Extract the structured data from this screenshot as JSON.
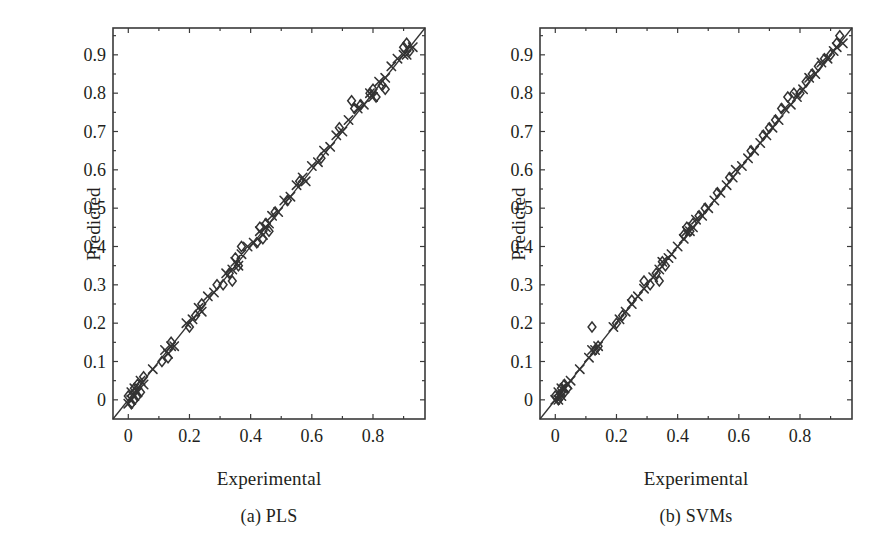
{
  "figure": {
    "panels": [
      {
        "id": "a",
        "caption": "(a) PLS",
        "xlabel": "Experimental",
        "ylabel": "Predicted"
      },
      {
        "id": "b",
        "caption": "(b) SVMs",
        "xlabel": "Experimental",
        "ylabel": "Predicted"
      }
    ]
  },
  "axis": {
    "y_ticks": [
      "0",
      "0.1",
      "0.2",
      "0.3",
      "0.4",
      "0.5",
      "0.6",
      "0.7",
      "0.8",
      "0.9"
    ],
    "y_tick_values": [
      0,
      0.1,
      0.2,
      0.3,
      0.4,
      0.5,
      0.6,
      0.7,
      0.8,
      0.9
    ],
    "x_ticks": [
      "0",
      "0.2",
      "0.4",
      "0.6",
      "0.8"
    ],
    "x_tick_values": [
      0,
      0.2,
      0.4,
      0.6,
      0.8
    ],
    "x_minor_values": [
      0.1,
      0.3,
      0.5,
      0.7,
      0.9
    ],
    "y_minor_values": [
      0.05,
      0.15,
      0.25,
      0.35,
      0.45,
      0.55,
      0.65,
      0.75,
      0.85,
      0.95
    ]
  },
  "colors": {
    "ink": "#231f20",
    "frame": "#3a3a3a",
    "marker": "#333333",
    "background": "#ffffff"
  },
  "chart_data": [
    {
      "type": "scatter",
      "title": "(a) PLS",
      "xlabel": "Experimental",
      "ylabel": "Predicted",
      "xlim": [
        -0.05,
        0.97
      ],
      "ylim": [
        -0.05,
        0.97
      ],
      "grid": false,
      "legend": null,
      "reference_line": {
        "label": "1:1 identity line",
        "x": [
          -0.05,
          0.97
        ],
        "y": [
          -0.05,
          0.97
        ]
      },
      "series": [
        {
          "name": "Calibration set",
          "marker": "x",
          "x": [
            0.0,
            0.01,
            0.01,
            0.02,
            0.02,
            0.03,
            0.04,
            0.05,
            0.08,
            0.12,
            0.13,
            0.14,
            0.15,
            0.19,
            0.21,
            0.23,
            0.24,
            0.26,
            0.28,
            0.32,
            0.34,
            0.35,
            0.36,
            0.37,
            0.39,
            0.41,
            0.43,
            0.44,
            0.45,
            0.46,
            0.47,
            0.49,
            0.51,
            0.53,
            0.55,
            0.57,
            0.58,
            0.6,
            0.62,
            0.64,
            0.66,
            0.68,
            0.7,
            0.72,
            0.75,
            0.77,
            0.79,
            0.8,
            0.82,
            0.84,
            0.86,
            0.88,
            0.9,
            0.91,
            0.93
          ],
          "y": [
            -0.01,
            0.0,
            0.02,
            0.01,
            0.03,
            0.02,
            0.05,
            0.04,
            0.08,
            0.13,
            0.12,
            0.14,
            0.14,
            0.2,
            0.21,
            0.24,
            0.23,
            0.27,
            0.28,
            0.33,
            0.34,
            0.36,
            0.35,
            0.38,
            0.4,
            0.41,
            0.44,
            0.43,
            0.45,
            0.46,
            0.48,
            0.49,
            0.52,
            0.53,
            0.56,
            0.58,
            0.57,
            0.61,
            0.62,
            0.65,
            0.66,
            0.69,
            0.7,
            0.73,
            0.76,
            0.77,
            0.8,
            0.79,
            0.83,
            0.84,
            0.87,
            0.89,
            0.9,
            0.9,
            0.92
          ]
        },
        {
          "name": "Validation set",
          "marker": "diamond",
          "x": [
            0.0,
            0.01,
            0.02,
            0.02,
            0.03,
            0.03,
            0.04,
            0.05,
            0.11,
            0.13,
            0.14,
            0.2,
            0.22,
            0.24,
            0.29,
            0.31,
            0.33,
            0.34,
            0.35,
            0.36,
            0.37,
            0.42,
            0.43,
            0.44,
            0.45,
            0.46,
            0.48,
            0.52,
            0.56,
            0.63,
            0.69,
            0.73,
            0.74,
            0.76,
            0.79,
            0.8,
            0.81,
            0.83,
            0.84,
            0.9,
            0.91,
            0.92
          ],
          "y": [
            0.01,
            -0.01,
            0.0,
            0.03,
            0.01,
            0.04,
            0.02,
            0.06,
            0.1,
            0.11,
            0.15,
            0.19,
            0.22,
            0.25,
            0.3,
            0.3,
            0.33,
            0.31,
            0.37,
            0.35,
            0.4,
            0.41,
            0.45,
            0.42,
            0.46,
            0.44,
            0.49,
            0.52,
            0.57,
            0.63,
            0.71,
            0.78,
            0.76,
            0.77,
            0.8,
            0.81,
            0.79,
            0.82,
            0.81,
            0.92,
            0.93,
            0.91
          ]
        }
      ]
    },
    {
      "type": "scatter",
      "title": "(b) SVMs",
      "xlabel": "Experimental",
      "ylabel": "Predicted",
      "xlim": [
        -0.05,
        0.97
      ],
      "ylim": [
        -0.05,
        0.97
      ],
      "grid": false,
      "legend": null,
      "reference_line": {
        "label": "1:1 identity line",
        "x": [
          -0.05,
          0.97
        ],
        "y": [
          -0.05,
          0.97
        ]
      },
      "series": [
        {
          "name": "Calibration set",
          "marker": "x",
          "x": [
            0.0,
            0.01,
            0.01,
            0.02,
            0.02,
            0.03,
            0.04,
            0.05,
            0.08,
            0.11,
            0.12,
            0.13,
            0.14,
            0.19,
            0.21,
            0.23,
            0.25,
            0.27,
            0.29,
            0.32,
            0.34,
            0.35,
            0.37,
            0.38,
            0.4,
            0.42,
            0.43,
            0.44,
            0.45,
            0.46,
            0.48,
            0.5,
            0.52,
            0.54,
            0.56,
            0.58,
            0.59,
            0.61,
            0.63,
            0.65,
            0.67,
            0.69,
            0.71,
            0.73,
            0.75,
            0.77,
            0.79,
            0.81,
            0.83,
            0.85,
            0.87,
            0.89,
            0.91,
            0.92,
            0.94
          ],
          "y": [
            0.0,
            0.0,
            0.02,
            0.01,
            0.03,
            0.03,
            0.04,
            0.05,
            0.08,
            0.11,
            0.13,
            0.13,
            0.14,
            0.19,
            0.21,
            0.23,
            0.25,
            0.27,
            0.29,
            0.32,
            0.34,
            0.36,
            0.37,
            0.38,
            0.4,
            0.42,
            0.44,
            0.44,
            0.45,
            0.47,
            0.48,
            0.5,
            0.52,
            0.54,
            0.56,
            0.58,
            0.6,
            0.61,
            0.63,
            0.65,
            0.67,
            0.69,
            0.71,
            0.73,
            0.76,
            0.77,
            0.79,
            0.81,
            0.84,
            0.85,
            0.88,
            0.89,
            0.91,
            0.92,
            0.93
          ]
        },
        {
          "name": "Validation set",
          "marker": "diamond",
          "x": [
            0.0,
            0.01,
            0.02,
            0.02,
            0.03,
            0.03,
            0.04,
            0.12,
            0.13,
            0.14,
            0.2,
            0.22,
            0.25,
            0.29,
            0.31,
            0.33,
            0.34,
            0.35,
            0.36,
            0.42,
            0.43,
            0.44,
            0.45,
            0.47,
            0.49,
            0.53,
            0.57,
            0.64,
            0.68,
            0.7,
            0.72,
            0.74,
            0.76,
            0.78,
            0.8,
            0.82,
            0.84,
            0.86,
            0.88,
            0.9,
            0.92,
            0.93
          ],
          "y": [
            0.01,
            0.0,
            0.01,
            0.03,
            0.02,
            0.04,
            0.03,
            0.19,
            0.13,
            0.14,
            0.2,
            0.22,
            0.26,
            0.31,
            0.3,
            0.33,
            0.31,
            0.36,
            0.35,
            0.43,
            0.45,
            0.44,
            0.46,
            0.48,
            0.5,
            0.54,
            0.58,
            0.65,
            0.69,
            0.71,
            0.73,
            0.76,
            0.79,
            0.8,
            0.8,
            0.83,
            0.85,
            0.87,
            0.89,
            0.9,
            0.93,
            0.95
          ]
        }
      ]
    }
  ]
}
